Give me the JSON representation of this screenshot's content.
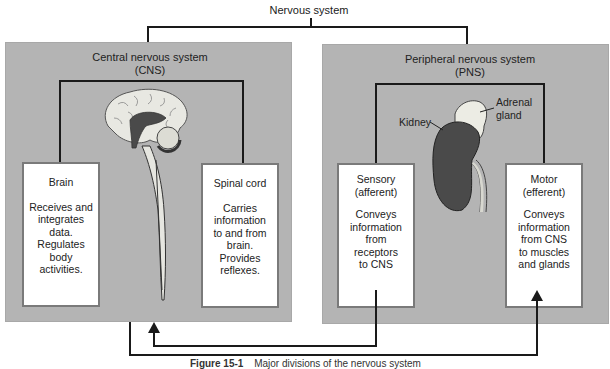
{
  "diagram": {
    "root": {
      "label": "Nervous system"
    },
    "cns": {
      "title_line1": "Central nervous system",
      "title_line2": "(CNS)",
      "illustration": "brain-and-spinal-cord",
      "brain": {
        "heading": "Brain",
        "description": "Receives and\nintegrates\ndata.\nRegulates\nbody\nactivities."
      },
      "spinal_cord": {
        "heading": "Spinal cord",
        "description": "Carries\ninformation\nto and from\nbrain.\nProvides\nreflexes."
      }
    },
    "pns": {
      "title_line1": "Peripheral nervous system",
      "title_line2": "(PNS)",
      "illustration": "kidney-and-adrenal-gland",
      "labels": {
        "kidney": "Kidney",
        "adrenal": "Adrenal\ngland"
      },
      "sensory": {
        "heading": "Sensory\n(afferent)",
        "description": "Conveys\ninformation\nfrom\nreceptors\nto CNS"
      },
      "motor": {
        "heading": "Motor\n(efferent)",
        "description": "Conveys\ninformation\nfrom CNS\nto muscles\nand glands"
      }
    },
    "flows": [
      {
        "from": "Sensory (afferent)",
        "to": "Central nervous system (CNS)"
      },
      {
        "from": "Central nervous system (CNS)",
        "to": "Motor (efferent)"
      }
    ],
    "caption": {
      "figure": "Figure 15-1",
      "text": "Major divisions of the nervous system"
    },
    "colors": {
      "panel": "#b4b4b4",
      "box_border": "#7a7a7a",
      "line": "#1a1a1a",
      "kidney": "#4a4a4a",
      "adrenal": "#e8e8e0"
    }
  }
}
